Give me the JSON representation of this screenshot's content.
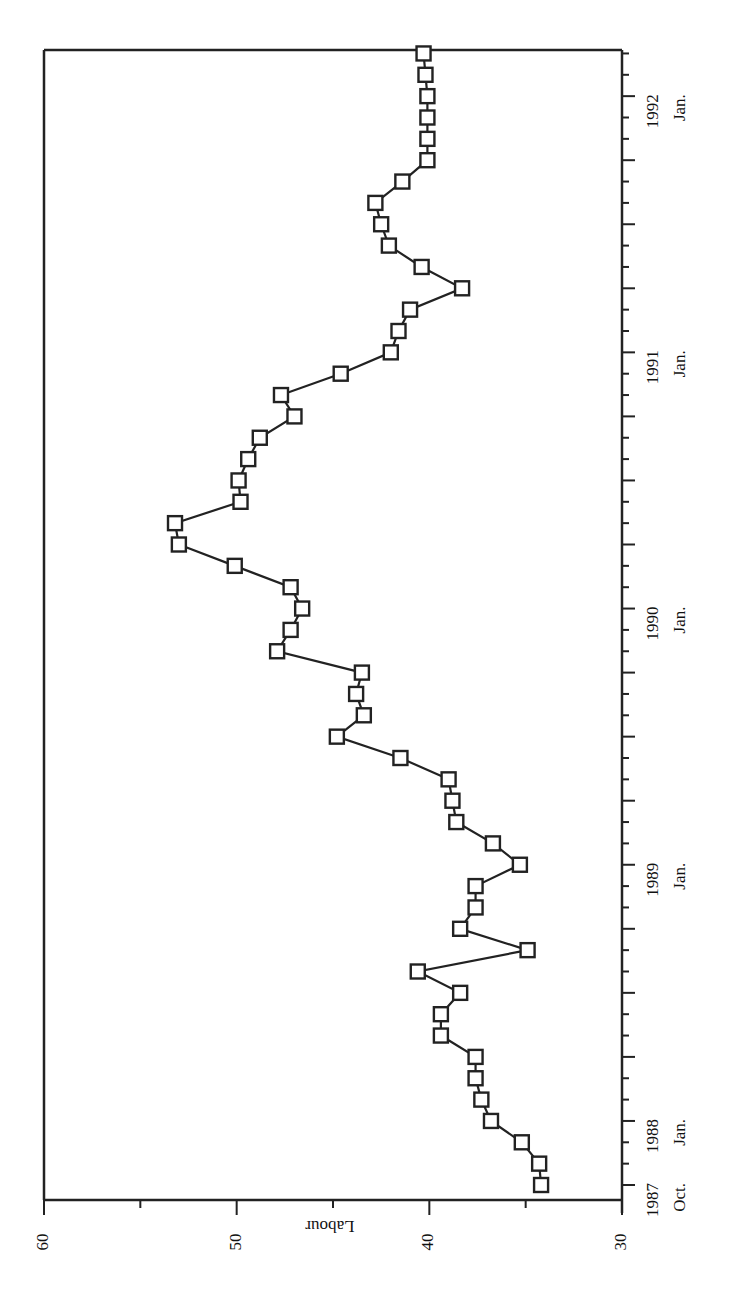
{
  "chart_data": {
    "type": "line",
    "orientation": "rotated 90 degrees clockwise (time runs bottom-to-top, values increase leftward)",
    "title": "",
    "xlabel": "",
    "ylabel": "Labour",
    "ylim": [
      30,
      60
    ],
    "y_ticks": [
      30,
      40,
      50,
      60
    ],
    "x_tick_labels": [
      {
        "year": "1987",
        "month": "Oct."
      },
      {
        "year": "1988",
        "month": "Jan."
      },
      {
        "year": "1989",
        "month": "Jan."
      },
      {
        "year": "1990",
        "month": "Jan."
      },
      {
        "year": "1991",
        "month": "Jan."
      },
      {
        "year": "1992",
        "month": "Jan."
      }
    ],
    "grid": false,
    "legend": null,
    "marker": "open-square",
    "series": [
      {
        "name": "Labour",
        "x": [
          "1987-10",
          "1987-11",
          "1987-12",
          "1988-01",
          "1988-02",
          "1988-03",
          "1988-04",
          "1988-05",
          "1988-06",
          "1988-07",
          "1988-08",
          "1988-09",
          "1988-10",
          "1988-11",
          "1988-12",
          "1989-01",
          "1989-02",
          "1989-03",
          "1989-04",
          "1989-05",
          "1989-06",
          "1989-07",
          "1989-08",
          "1989-09",
          "1989-10",
          "1989-11",
          "1989-12",
          "1990-01",
          "1990-02",
          "1990-03",
          "1990-04",
          "1990-05",
          "1990-06",
          "1990-07",
          "1990-08",
          "1990-09",
          "1990-10",
          "1990-11",
          "1990-12",
          "1991-01",
          "1991-02",
          "1991-03",
          "1991-04",
          "1991-05",
          "1991-06",
          "1991-07",
          "1991-08",
          "1991-09",
          "1991-10",
          "1991-11",
          "1991-12",
          "1992-01",
          "1992-02",
          "1992-03"
        ],
        "values": [
          34.2,
          34.3,
          35.2,
          36.8,
          37.3,
          37.6,
          37.6,
          39.4,
          39.4,
          38.4,
          40.6,
          34.9,
          38.4,
          37.6,
          37.6,
          35.3,
          36.7,
          38.6,
          38.8,
          39.0,
          41.5,
          44.8,
          43.4,
          43.8,
          43.5,
          47.9,
          47.2,
          46.6,
          47.2,
          50.1,
          53.0,
          53.2,
          49.8,
          49.9,
          49.4,
          48.8,
          47.0,
          47.7,
          44.6,
          42.0,
          41.6,
          41.0,
          38.3,
          40.4,
          42.1,
          42.5,
          42.8,
          41.4,
          40.1,
          40.1,
          40.1,
          40.1,
          40.2,
          40.3
        ]
      }
    ]
  }
}
